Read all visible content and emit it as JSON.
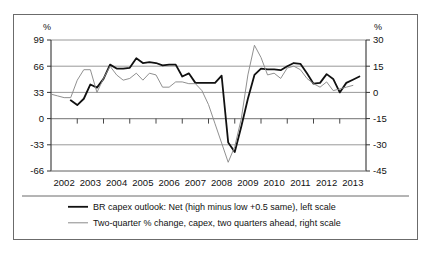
{
  "figure": {
    "left_axis_unit": "%",
    "right_axis_unit": "%",
    "border_color": "#6b6b6b"
  },
  "legend": {
    "items": [
      {
        "label": "BR capex outlook: Net (high minus low +0.5 same), left scale",
        "color": "#111111",
        "width": 1.8
      },
      {
        "label": "Two-quarter % change, capex, two quarters ahead, right scale",
        "color": "#8a8a8a",
        "width": 1.0
      }
    ]
  },
  "chart_data": {
    "type": "line",
    "title": "",
    "subtitle": "",
    "xlabel": "",
    "ylabel": "%",
    "y2label": "%",
    "grid": true,
    "legend_position": "bottom",
    "x_tick_labels": [
      "2002",
      "2003",
      "2004",
      "2005",
      "2006",
      "2007",
      "2008",
      "2009",
      "2010",
      "2011",
      "2012",
      "2013"
    ],
    "xlim": [
      2002.0,
      2014.0
    ],
    "ylim": [
      -66,
      99
    ],
    "y_ticks": [
      99,
      66,
      33,
      0,
      -33,
      -66
    ],
    "y2lim": [
      -45,
      30
    ],
    "y2_ticks": [
      30,
      15,
      0,
      -15,
      -30,
      -45
    ],
    "series": [
      {
        "name": "BR capex outlook: Net (high minus low +0.5 same), left scale",
        "axis": "left",
        "color": "#111111",
        "x": [
          2002.75,
          2003.0,
          2003.25,
          2003.5,
          2003.75,
          2004.0,
          2004.25,
          2004.5,
          2004.75,
          2005.0,
          2005.25,
          2005.5,
          2005.75,
          2006.0,
          2006.25,
          2006.5,
          2006.75,
          2007.0,
          2007.25,
          2007.5,
          2007.75,
          2008.0,
          2008.25,
          2008.5,
          2008.75,
          2009.0,
          2009.25,
          2009.5,
          2009.75,
          2010.0,
          2010.25,
          2010.5,
          2010.75,
          2011.0,
          2011.25,
          2011.5,
          2011.75,
          2012.0,
          2012.25,
          2012.5,
          2012.75,
          2013.0,
          2013.25,
          2013.5,
          2013.75
        ],
        "values": [
          23,
          17,
          25,
          43,
          39,
          50,
          68,
          63,
          63,
          64,
          76,
          70,
          71,
          70,
          67,
          68,
          68,
          53,
          57,
          45,
          45,
          45,
          45,
          54,
          -30,
          -42,
          -10,
          25,
          55,
          63,
          62,
          62,
          61,
          66,
          70,
          69,
          57,
          44,
          45,
          56,
          50,
          33,
          45,
          49,
          53
        ]
      },
      {
        "name": "Two-quarter % change, capex, two quarters ahead, right scale",
        "axis": "right",
        "color": "#8a8a8a",
        "x": [
          2002.0,
          2002.25,
          2002.5,
          2002.75,
          2003.0,
          2003.25,
          2003.5,
          2003.75,
          2004.0,
          2004.25,
          2004.5,
          2004.75,
          2005.0,
          2005.25,
          2005.5,
          2005.75,
          2006.0,
          2006.25,
          2006.5,
          2006.75,
          2007.0,
          2007.25,
          2007.5,
          2007.75,
          2008.0,
          2008.25,
          2008.5,
          2008.75,
          2009.0,
          2009.25,
          2009.5,
          2009.75,
          2010.0,
          2010.25,
          2010.5,
          2010.75,
          2011.0,
          2011.25,
          2011.5,
          2011.75,
          2012.0,
          2012.25,
          2012.5,
          2012.75,
          2013.0,
          2013.25,
          2013.5
        ],
        "values": [
          -1,
          -2,
          -3,
          -3,
          7,
          13,
          13,
          0,
          8,
          15,
          10,
          7,
          8,
          11,
          7,
          11,
          10,
          3,
          3,
          6,
          6,
          5,
          5,
          1,
          -7,
          -18,
          -29,
          -40,
          -31,
          -15,
          10,
          27,
          20,
          10,
          11,
          8,
          14,
          15,
          13,
          8,
          5,
          3,
          6,
          1,
          2,
          3,
          4
        ]
      }
    ]
  }
}
